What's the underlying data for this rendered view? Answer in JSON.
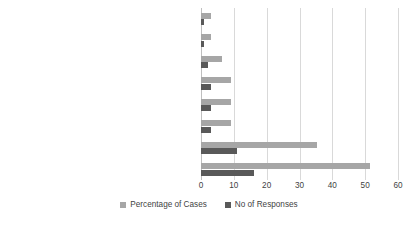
{
  "chart_data": {
    "type": "bar",
    "orientation": "horizontal",
    "title": "",
    "subtitle": "",
    "xlabel": "",
    "ylabel": "",
    "xlim": [
      0,
      60
    ],
    "xticks": [
      0,
      10,
      20,
      30,
      40,
      50,
      60
    ],
    "grid": true,
    "legend_position": "bottom",
    "categories": [
      "Other",
      "Low quality of Social Insurance service",
      "Disappointed with the scheme/coverage",
      "Procedures too complicated",
      "Lack of a stable job/Remittance",
      "I did not make use of it (have no specific\nhealth problems)",
      "Left previous Job/school/college/Divorced",
      "It was too expensive"
    ],
    "series": [
      {
        "name": "Percentage of Cases",
        "color": "#a6a6a6",
        "values": [
          3.0,
          3.0,
          6.4,
          9.1,
          9.1,
          9.1,
          35.2,
          51.5
        ]
      },
      {
        "name": "No of Responses",
        "color": "#595959",
        "values": [
          1.0,
          1.0,
          2.0,
          3.0,
          3.0,
          3.0,
          11.0,
          16.0
        ]
      }
    ]
  },
  "legend": {
    "items": [
      {
        "label": "Percentage of Cases"
      },
      {
        "label": "No of Responses"
      }
    ]
  },
  "colors": {
    "percentage_of_cases": "#a6a6a6",
    "no_of_responses": "#595959",
    "gridline": "#d9d9d9",
    "axis": "#bfbfbf",
    "text": "#3f3f3f",
    "background": "#ffffff"
  }
}
